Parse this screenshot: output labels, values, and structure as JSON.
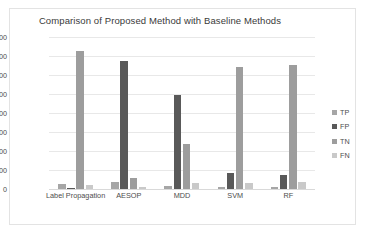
{
  "chart_data": {
    "type": "bar",
    "title": "Comparison of Proposed Method with Baseline Methods",
    "xlabel": "",
    "ylabel": "",
    "ylim": [
      0,
      4000
    ],
    "yticks": [
      4000,
      3500,
      3000,
      2500,
      2000,
      1500,
      1000,
      500,
      0
    ],
    "grid": true,
    "legend_position": "right",
    "categories": [
      "Label Propagation",
      "AESOP",
      "MDD",
      "SVM",
      "RF"
    ],
    "series": [
      {
        "name": "TP",
        "color": "#a6a6a6",
        "values": [
          130,
          180,
          80,
          55,
          40
        ]
      },
      {
        "name": "FP",
        "color": "#595959",
        "values": [
          35,
          3370,
          2480,
          430,
          370
        ]
      },
      {
        "name": "TN",
        "color": "#9d9d9d",
        "values": [
          3620,
          300,
          1180,
          3200,
          3260
        ]
      },
      {
        "name": "FN",
        "color": "#c9c9c9",
        "values": [
          105,
          50,
          160,
          165,
          180
        ]
      }
    ]
  }
}
